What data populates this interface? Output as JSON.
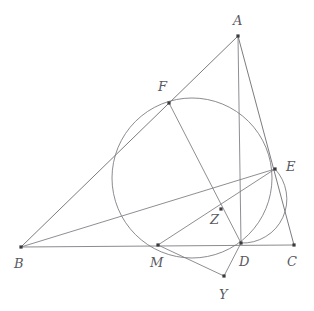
{
  "figure": {
    "width": 314,
    "height": 311,
    "background_color": "#ffffff",
    "line_color": "#6d6d72",
    "point_color": "#3a3a3f",
    "label_color": "#59595f"
  },
  "points": [
    {
      "id": "A",
      "label": "A",
      "x": 238,
      "y": 36,
      "label_x": 233,
      "label_y": 14
    },
    {
      "id": "B",
      "label": "B",
      "x": 21,
      "y": 247,
      "label_x": 14,
      "label_y": 257
    },
    {
      "id": "C",
      "label": "C",
      "x": 294,
      "y": 245,
      "label_x": 287,
      "label_y": 255
    },
    {
      "id": "D",
      "label": "D",
      "x": 241,
      "y": 243,
      "label_x": 239,
      "label_y": 255
    },
    {
      "id": "E",
      "label": "E",
      "x": 275,
      "y": 169,
      "label_x": 286,
      "label_y": 160
    },
    {
      "id": "F",
      "label": "F",
      "x": 169,
      "y": 103,
      "label_x": 158,
      "label_y": 80
    },
    {
      "id": "M",
      "label": "M",
      "x": 158,
      "y": 245,
      "label_x": 150,
      "label_y": 256
    },
    {
      "id": "Y",
      "label": "Y",
      "x": 224,
      "y": 276,
      "label_x": 219,
      "label_y": 288
    },
    {
      "id": "Z",
      "label": "Z",
      "x": 221,
      "y": 209,
      "label_x": 210,
      "label_y": 213
    }
  ],
  "segments": [
    {
      "name": "side-AB",
      "from": "A",
      "to": "B"
    },
    {
      "name": "side-AC",
      "from": "A",
      "to": "C"
    },
    {
      "name": "side-BC",
      "from": "B",
      "to": "C",
      "style": "base"
    },
    {
      "name": "cevian-AD",
      "from": "A",
      "to": "D"
    },
    {
      "name": "cevian-BE",
      "from": "B",
      "to": "E"
    },
    {
      "name": "chord-FD",
      "from": "F",
      "to": "D"
    },
    {
      "name": "chord-ME",
      "from": "M",
      "to": "E"
    },
    {
      "name": "segment-MY",
      "from": "M",
      "to": "Y"
    },
    {
      "name": "segment-YD",
      "from": "Y",
      "to": "D"
    }
  ],
  "circles": [
    {
      "name": "incircle",
      "cx": 192,
      "cy": 178,
      "r": 80
    }
  ],
  "arcs": [
    {
      "name": "arc-E-to-D",
      "from": "E",
      "to": "D",
      "rx": 44,
      "ry": 44,
      "sweep": 1,
      "large_arc": 0
    }
  ],
  "labels": {
    "A": "A",
    "B": "B",
    "C": "C",
    "D": "D",
    "E": "E",
    "F": "F",
    "M": "M",
    "Y": "Y",
    "Z": "Z"
  }
}
